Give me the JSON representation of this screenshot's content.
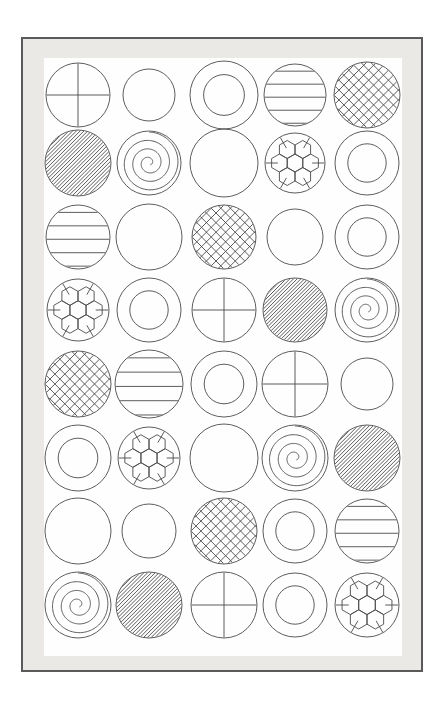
{
  "page": {
    "canvas_width": 444,
    "canvas_height": 719,
    "background_color": "#ffffff"
  },
  "frame": {
    "name": "picture-frame",
    "x": 21,
    "y": 37,
    "width": 402,
    "height": 635,
    "border_color": "#5a5a5a",
    "border_width": 2,
    "mat_color": "#ebe9e6"
  },
  "paper": {
    "name": "inner-paper",
    "x": 21,
    "y": 19,
    "width": 358,
    "height": 598,
    "color": "#fefefe"
  },
  "style": {
    "stroke_color": "#4b4b4b",
    "stroke_width": 0.9,
    "fill": "none"
  },
  "grid": {
    "rows": 8,
    "columns": 5,
    "column_centers": [
      55,
      126,
      201,
      272,
      344
    ],
    "row_centers": [
      56,
      124,
      198,
      271,
      345,
      419,
      492,
      566
    ],
    "circle_radii_note": "radius varies per cell; see cells[].r"
  },
  "legend": {
    "pattern_names": [
      "cross",
      "plain",
      "concentric-ring",
      "horizontal-stripes",
      "crosshatch",
      "diagonal-hatch",
      "spiral",
      "soccer-hexagon"
    ]
  },
  "cells": [
    {
      "row": 0,
      "col": 0,
      "pattern": "cross",
      "cx": 55,
      "cy": 56,
      "r": 32
    },
    {
      "row": 0,
      "col": 1,
      "pattern": "plain",
      "cx": 126,
      "cy": 56,
      "r": 26
    },
    {
      "row": 0,
      "col": 2,
      "pattern": "concentric-ring",
      "cx": 201,
      "cy": 56,
      "r": 34
    },
    {
      "row": 0,
      "col": 3,
      "pattern": "horizontal-stripes",
      "cx": 272,
      "cy": 56,
      "r": 31
    },
    {
      "row": 0,
      "col": 4,
      "pattern": "crosshatch",
      "cx": 344,
      "cy": 56,
      "r": 33
    },
    {
      "row": 1,
      "col": 0,
      "pattern": "diagonal-hatch",
      "cx": 55,
      "cy": 124,
      "r": 33
    },
    {
      "row": 1,
      "col": 1,
      "pattern": "spiral",
      "cx": 126,
      "cy": 124,
      "r": 32
    },
    {
      "row": 1,
      "col": 2,
      "pattern": "plain",
      "cx": 201,
      "cy": 124,
      "r": 34
    },
    {
      "row": 1,
      "col": 3,
      "pattern": "soccer-hexagon",
      "cx": 272,
      "cy": 124,
      "r": 30
    },
    {
      "row": 1,
      "col": 4,
      "pattern": "concentric-ring",
      "cx": 344,
      "cy": 124,
      "r": 32
    },
    {
      "row": 2,
      "col": 0,
      "pattern": "horizontal-stripes",
      "cx": 55,
      "cy": 198,
      "r": 32
    },
    {
      "row": 2,
      "col": 1,
      "pattern": "plain",
      "cx": 126,
      "cy": 198,
      "r": 33
    },
    {
      "row": 2,
      "col": 2,
      "pattern": "crosshatch",
      "cx": 201,
      "cy": 198,
      "r": 32
    },
    {
      "row": 2,
      "col": 3,
      "pattern": "plain",
      "cx": 272,
      "cy": 198,
      "r": 28
    },
    {
      "row": 2,
      "col": 4,
      "pattern": "concentric-ring",
      "cx": 344,
      "cy": 198,
      "r": 32
    },
    {
      "row": 3,
      "col": 0,
      "pattern": "soccer-hexagon",
      "cx": 55,
      "cy": 271,
      "r": 31
    },
    {
      "row": 3,
      "col": 1,
      "pattern": "concentric-ring",
      "cx": 126,
      "cy": 271,
      "r": 32
    },
    {
      "row": 3,
      "col": 2,
      "pattern": "cross",
      "cx": 201,
      "cy": 271,
      "r": 32
    },
    {
      "row": 3,
      "col": 3,
      "pattern": "diagonal-hatch",
      "cx": 272,
      "cy": 271,
      "r": 32
    },
    {
      "row": 3,
      "col": 4,
      "pattern": "spiral",
      "cx": 344,
      "cy": 271,
      "r": 32
    },
    {
      "row": 4,
      "col": 0,
      "pattern": "crosshatch",
      "cx": 55,
      "cy": 345,
      "r": 33
    },
    {
      "row": 4,
      "col": 1,
      "pattern": "horizontal-stripes",
      "cx": 126,
      "cy": 345,
      "r": 34
    },
    {
      "row": 4,
      "col": 2,
      "pattern": "concentric-ring",
      "cx": 201,
      "cy": 345,
      "r": 33
    },
    {
      "row": 4,
      "col": 3,
      "pattern": "cross",
      "cx": 272,
      "cy": 345,
      "r": 33
    },
    {
      "row": 4,
      "col": 4,
      "pattern": "plain",
      "cx": 344,
      "cy": 345,
      "r": 26
    },
    {
      "row": 5,
      "col": 0,
      "pattern": "concentric-ring",
      "cx": 55,
      "cy": 419,
      "r": 33
    },
    {
      "row": 5,
      "col": 1,
      "pattern": "soccer-hexagon",
      "cx": 126,
      "cy": 419,
      "r": 31
    },
    {
      "row": 5,
      "col": 2,
      "pattern": "plain",
      "cx": 201,
      "cy": 419,
      "r": 34
    },
    {
      "row": 5,
      "col": 3,
      "pattern": "spiral",
      "cx": 272,
      "cy": 419,
      "r": 33
    },
    {
      "row": 5,
      "col": 4,
      "pattern": "diagonal-hatch",
      "cx": 344,
      "cy": 419,
      "r": 33
    },
    {
      "row": 6,
      "col": 0,
      "pattern": "plain",
      "cx": 55,
      "cy": 492,
      "r": 33
    },
    {
      "row": 6,
      "col": 1,
      "pattern": "plain",
      "cx": 126,
      "cy": 492,
      "r": 27
    },
    {
      "row": 6,
      "col": 2,
      "pattern": "crosshatch",
      "cx": 201,
      "cy": 492,
      "r": 33
    },
    {
      "row": 6,
      "col": 3,
      "pattern": "concentric-ring",
      "cx": 272,
      "cy": 492,
      "r": 32
    },
    {
      "row": 6,
      "col": 4,
      "pattern": "horizontal-stripes",
      "cx": 344,
      "cy": 492,
      "r": 32
    },
    {
      "row": 7,
      "col": 0,
      "pattern": "spiral",
      "cx": 55,
      "cy": 566,
      "r": 33
    },
    {
      "row": 7,
      "col": 1,
      "pattern": "diagonal-hatch",
      "cx": 126,
      "cy": 566,
      "r": 33
    },
    {
      "row": 7,
      "col": 2,
      "pattern": "cross",
      "cx": 201,
      "cy": 566,
      "r": 33
    },
    {
      "row": 7,
      "col": 3,
      "pattern": "concentric-ring",
      "cx": 272,
      "cy": 566,
      "r": 32
    },
    {
      "row": 7,
      "col": 4,
      "pattern": "soccer-hexagon",
      "cx": 344,
      "cy": 566,
      "r": 32
    }
  ]
}
